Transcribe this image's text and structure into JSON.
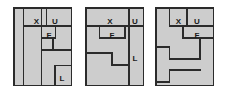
{
  "figure": {
    "caption": "",
    "background_color": "#ffffff",
    "panel_fill": "#cdcdcd",
    "panel_border_color": "#2b2b2b",
    "line_color": "#2b2b2b",
    "label_color": "#1a1a1a",
    "panel_count": 3
  },
  "panels": [
    {
      "id": "panel-1",
      "x": 13,
      "y": 7,
      "width": 59,
      "height": 79,
      "labels": [
        {
          "text": "X",
          "x": 23.5,
          "y": 9.5
        },
        {
          "text": "U",
          "x": 42.0,
          "y": 9.5
        },
        {
          "text": "F",
          "x": 36.0,
          "y": 24.0
        },
        {
          "text": "L",
          "x": 49.0,
          "y": 67.0
        }
      ],
      "lines": [
        {
          "x1": 10.5,
          "y1": 0,
          "x2": 10.5,
          "y2": 79
        },
        {
          "x1": 28.5,
          "y1": 0,
          "x2": 28.5,
          "y2": 79
        },
        {
          "x1": 10.5,
          "y1": 19.0,
          "x2": 59,
          "y2": 19.0
        },
        {
          "x1": 33.5,
          "y1": 0,
          "x2": 33.5,
          "y2": 19.0
        },
        {
          "x1": 28.5,
          "y1": 31.0,
          "x2": 42.5,
          "y2": 31.0
        },
        {
          "x1": 42.5,
          "y1": 19.0,
          "x2": 42.5,
          "y2": 31.0
        },
        {
          "x1": 40.0,
          "y1": 43.0,
          "x2": 59,
          "y2": 43.0
        },
        {
          "x1": 40.0,
          "y1": 31.0,
          "x2": 40.0,
          "y2": 43.0
        },
        {
          "x1": 28.5,
          "y1": 43.0,
          "x2": 40.0,
          "y2": 43.0
        },
        {
          "x1": 42.0,
          "y1": 58.5,
          "x2": 59,
          "y2": 58.5
        },
        {
          "x1": 42.0,
          "y1": 58.5,
          "x2": 42.0,
          "y2": 79
        }
      ]
    },
    {
      "id": "panel-2",
      "x": 85,
      "y": 7,
      "width": 59,
      "height": 79,
      "labels": [
        {
          "text": "X",
          "x": 25.0,
          "y": 9.5
        },
        {
          "text": "U",
          "x": 50.0,
          "y": 9.5
        },
        {
          "text": "F",
          "x": 27.0,
          "y": 24.0
        },
        {
          "text": "L",
          "x": 50.0,
          "y": 47.0
        }
      ],
      "lines": [
        {
          "x1": 0,
          "y1": 19.0,
          "x2": 44.0,
          "y2": 19.0
        },
        {
          "x1": 44.0,
          "y1": 0,
          "x2": 44.0,
          "y2": 79
        },
        {
          "x1": 44.0,
          "y1": 19.0,
          "x2": 59,
          "y2": 19.0
        },
        {
          "x1": 14.5,
          "y1": 19.0,
          "x2": 14.5,
          "y2": 31.0
        },
        {
          "x1": 14.5,
          "y1": 31.0,
          "x2": 40.0,
          "y2": 31.0
        },
        {
          "x1": 40.0,
          "y1": 19.0,
          "x2": 40.0,
          "y2": 31.0
        },
        {
          "x1": 0,
          "y1": 46.0,
          "x2": 27.0,
          "y2": 46.0
        },
        {
          "x1": 27.0,
          "y1": 46.0,
          "x2": 27.0,
          "y2": 58.0
        },
        {
          "x1": 27.0,
          "y1": 58.0,
          "x2": 44.0,
          "y2": 58.0
        }
      ]
    },
    {
      "id": "panel-3",
      "x": 155,
      "y": 7,
      "width": 59,
      "height": 79,
      "labels": [
        {
          "text": "X",
          "x": 23.5,
          "y": 9.5
        },
        {
          "text": "U",
          "x": 42.0,
          "y": 9.5
        },
        {
          "text": "F",
          "x": 42.0,
          "y": 24.0
        }
      ],
      "lines": [
        {
          "x1": 14.5,
          "y1": 0,
          "x2": 14.5,
          "y2": 19.0
        },
        {
          "x1": 14.5,
          "y1": 19.0,
          "x2": 28.0,
          "y2": 19.0
        },
        {
          "x1": 28.0,
          "y1": 19.0,
          "x2": 28.0,
          "y2": 31.0
        },
        {
          "x1": 28.0,
          "y1": 31.0,
          "x2": 59,
          "y2": 31.0
        },
        {
          "x1": 32.0,
          "y1": 0,
          "x2": 32.0,
          "y2": 19.0
        },
        {
          "x1": 28.0,
          "y1": 19.0,
          "x2": 59,
          "y2": 19.0
        },
        {
          "x1": 0,
          "y1": 40.0,
          "x2": 14.5,
          "y2": 40.0
        },
        {
          "x1": 14.5,
          "y1": 40.0,
          "x2": 14.5,
          "y2": 52.0
        },
        {
          "x1": 14.5,
          "y1": 52.0,
          "x2": 45.0,
          "y2": 52.0
        },
        {
          "x1": 45.0,
          "y1": 31.0,
          "x2": 45.0,
          "y2": 52.0
        },
        {
          "x1": 14.5,
          "y1": 63.0,
          "x2": 45.0,
          "y2": 63.0
        },
        {
          "x1": 14.5,
          "y1": 63.0,
          "x2": 14.5,
          "y2": 75.0
        },
        {
          "x1": 0,
          "y1": 75.0,
          "x2": 14.5,
          "y2": 75.0
        }
      ]
    }
  ]
}
